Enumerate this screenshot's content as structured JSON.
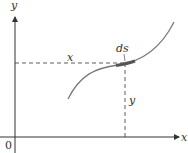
{
  "diagram": {
    "labels": {
      "y_axis": "y",
      "x_axis": "x",
      "origin": "0",
      "horizontal_distance": "x",
      "arc_element": "ds",
      "vertical_distance": "y"
    },
    "colors": {
      "axis": "#333333",
      "curve": "#7a7a7a",
      "arc_highlight": "#555555",
      "dashed": "#333333"
    }
  }
}
